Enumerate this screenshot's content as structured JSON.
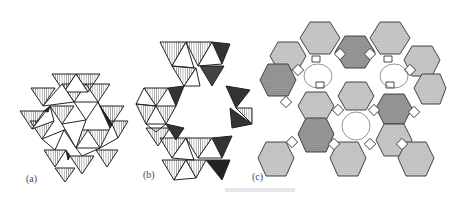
{
  "figure": {
    "panels": [
      {
        "id": "a",
        "label": "(a)",
        "description": "Close-packed assembly of SiO4/AlO4 tetrahedra (hatched triangles)"
      },
      {
        "id": "b",
        "label": "(b)",
        "description": "Ring of corner-sharing tetrahedra forming a channel"
      },
      {
        "id": "c",
        "label": "(c)",
        "description": "Zeolite framework of sodalite cages (dotted hexagonal faces) linked by square prisms"
      }
    ],
    "colors": {
      "line": "#222222",
      "hatch": "#555555",
      "dot_fill": "#bdbdbd",
      "dark_fill": "#333333",
      "background": "#ffffff"
    }
  }
}
